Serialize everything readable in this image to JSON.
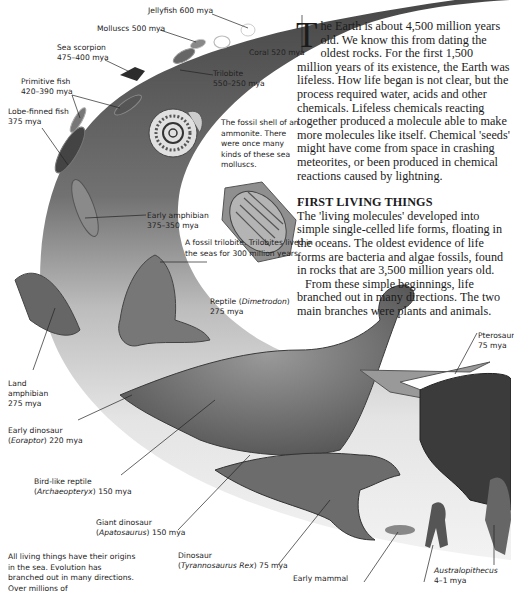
{
  "article": {
    "dropcap": "T",
    "intro": "he Earth is about 4,500 million years old. We know this from dating the oldest rocks. For the first 1,500 million years of its existence, the Earth was lifeless. How life began is not clear, but the process required water, acids and other chemicals. Lifeless chemicals reacting together produced a molecule able to make more molecules like itself. Chemical 'seeds' might have come from space in crashing meteorites, or been produced in chemical reactions caused by lightning.",
    "section_heading": "FIRST LIVING THINGS",
    "section_para1": "The 'living molecules' developed into simple single-celled life forms, floating in the oceans. The oldest evidence of life forms are bacteria and algae fossils, found in rocks that are 3,500 million years old.",
    "section_para2": "From these simple beginnings, life branched out in many directions. The two main branches were plants and animals."
  },
  "labels": {
    "jellyfish": "Jellyfish 600 mya",
    "molluscs": "Molluscs 500 mya",
    "coral": "Coral 520 mya",
    "sea_scorpion_name": "Sea scorpion",
    "sea_scorpion_age": "475–400 mya",
    "trilobite_name": "Trilobite",
    "trilobite_age": "550–250 mya",
    "primitive_fish_name": "Primitive fish",
    "primitive_fish_age": "420–390 mya",
    "lobe_fish_name": "Lobe-finned fish",
    "lobe_fish_age": "375 mya",
    "early_amphibian_name": "Early amphibian",
    "early_amphibian_age": "375–350 mya",
    "reptile_name": "Reptile (",
    "reptile_species": "Dimetrodon",
    "reptile_close": ")",
    "reptile_age": "275 mya",
    "land_amphibian_l1": "Land",
    "land_amphibian_l2": "amphibian",
    "land_amphibian_age": "275 mya",
    "early_dino_name": "Early dinosaur",
    "early_dino_species": "Eoraptor",
    "early_dino_age": ") 220 mya",
    "bird_name": "Bird-like reptile",
    "bird_species": "Archaeopteryx",
    "bird_age": ") 150 mya",
    "giant_name": "Giant dinosaur",
    "giant_species": "Apatosaurus",
    "giant_age": ") 150 mya",
    "trex_name": "Dinosaur",
    "trex_species": "Tyrannosaurus Rex",
    "trex_age": ") 75 mya",
    "pterosaur_name": "Pterosaur",
    "pterosaur_age": "75 mya",
    "early_mammal": "Early mammal",
    "australopithecus_name": "Australopithecus",
    "australopithecus_age": "4–1 mya",
    "open_paren": "("
  },
  "captions": {
    "ammonite": "The fossil shell of an ammonite. There were once many kinds of these sea molluscs.",
    "trilobite_fossil": "A fossil trilobite. Trilobites lived in the seas for 300 million years.",
    "footer": "All living things have their origins in the sea. Evolution has branched out in many directions. Over millions of"
  },
  "colors": {
    "band_dark": "#4a4a4a",
    "band_light": "#e6e6e6",
    "text": "#1b1b1b"
  }
}
